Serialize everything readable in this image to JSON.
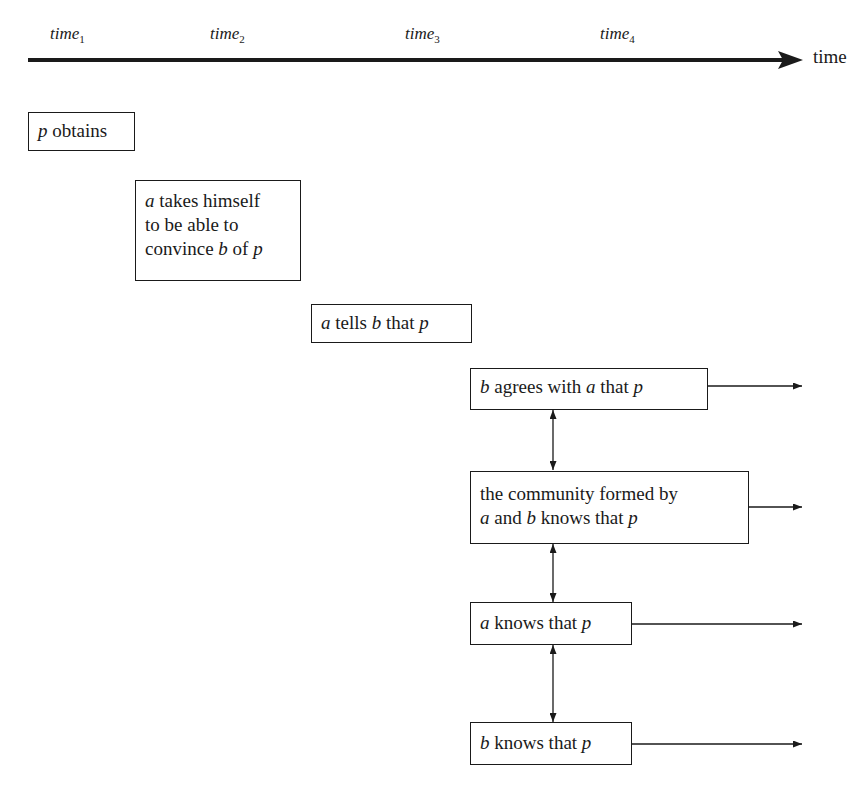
{
  "timeline": {
    "axis_label": "time",
    "ticks": [
      {
        "base": "time",
        "sub": "1"
      },
      {
        "base": "time",
        "sub": "2"
      },
      {
        "base": "time",
        "sub": "3"
      },
      {
        "base": "time",
        "sub": "4"
      }
    ]
  },
  "boxes": {
    "p_obtains": {
      "v1": "p",
      "t1": " obtains"
    },
    "a_takes": {
      "v1": "a",
      "t1": " takes himself",
      "t2": "to be able to",
      "t3": "convince ",
      "v2": "b",
      "t4": " of ",
      "v3": "p"
    },
    "a_tells": {
      "v1": "a",
      "t1": " tells ",
      "v2": "b",
      "t2": " that ",
      "v3": "p"
    },
    "b_agrees": {
      "v1": "b",
      "t1": " agrees with ",
      "v2": "a",
      "t2": " that ",
      "v3": "p"
    },
    "community": {
      "t1": "the community formed by",
      "v1": "a",
      "t2": " and ",
      "v2": "b",
      "t3": " knows that ",
      "v3": "p"
    },
    "a_knows": {
      "v1": "a",
      "t1": " knows that ",
      "v2": "p"
    },
    "b_knows": {
      "v1": "b",
      "t1": " knows that ",
      "v2": "p"
    }
  }
}
